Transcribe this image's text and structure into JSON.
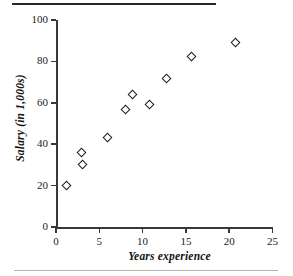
{
  "figure": {
    "background_color": "#ffffff",
    "ink_color": "#1a1a1a",
    "rule_top_color": "#2a2724",
    "rule_bottom_color": "#b7b3ae"
  },
  "chart_data": {
    "type": "scatter",
    "title": "",
    "xlabel": "Years experience",
    "ylabel": "Salary (in 1,000s)",
    "xlim": [
      0,
      25
    ],
    "ylim": [
      0,
      100
    ],
    "xticks": [
      0,
      5,
      10,
      15,
      20,
      25
    ],
    "yticks": [
      0,
      20,
      40,
      60,
      80,
      100
    ],
    "xtick_labels": [
      "0",
      "5",
      "10",
      "15",
      "20",
      "25"
    ],
    "ytick_labels": [
      "0",
      "20",
      "40",
      "60",
      "80",
      "100"
    ],
    "grid": false,
    "legend": null,
    "marker": "open-diamond",
    "marker_color": "#1b1b1b",
    "series": [
      {
        "name": "Salary vs. years experience",
        "points": [
          {
            "x": 1.2,
            "y": 20.0
          },
          {
            "x": 3.0,
            "y": 36.2
          },
          {
            "x": 3.1,
            "y": 30.2
          },
          {
            "x": 5.9,
            "y": 43.3
          },
          {
            "x": 8.0,
            "y": 57.0
          },
          {
            "x": 8.8,
            "y": 64.0
          },
          {
            "x": 10.8,
            "y": 59.0
          },
          {
            "x": 12.8,
            "y": 71.5
          },
          {
            "x": 15.7,
            "y": 82.5
          },
          {
            "x": 20.7,
            "y": 89.0
          }
        ]
      }
    ]
  }
}
